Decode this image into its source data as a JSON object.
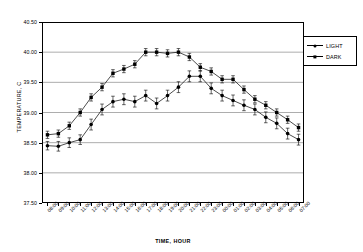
{
  "chart_data": {
    "type": "line",
    "title": "",
    "xlabel": "TIME, HOUR",
    "ylabel": "TEMPERATURE, C",
    "ylim": [
      37.5,
      40.5
    ],
    "ytick_step": 0.5,
    "ytick_labels": [
      "40.50",
      "40.00",
      "39.50",
      "39.00",
      "38.50",
      "38.00",
      "37.50"
    ],
    "ytick_values": [
      40.5,
      40.0,
      39.5,
      39.0,
      38.5,
      38.0,
      37.5
    ],
    "grid": "horizontal",
    "legend_position": "right-top",
    "error_bars": true,
    "categories": [
      "08:00",
      "09:00",
      "10:00",
      "11:00",
      "12:00",
      "13:00",
      "14:00",
      "15:00",
      "16:00",
      "17:00",
      "18:00",
      "19:00",
      "20:00",
      "21:00",
      "22:00",
      "23:00",
      "00:00",
      "01:00",
      "02:00",
      "03:00",
      "04:00",
      "05:00",
      "06:00",
      "07:00"
    ],
    "x": [
      "08:00",
      "09:00",
      "10:00",
      "11:00",
      "12:00",
      "13:00",
      "14:00",
      "15:00",
      "16:00",
      "17:00",
      "18:00",
      "19:00",
      "20:00",
      "21:00",
      "22:00",
      "23:00",
      "00:00",
      "01:00",
      "02:00",
      "03:00",
      "04:00",
      "05:00",
      "06:00",
      "07:00"
    ],
    "series": [
      {
        "name": "LIGHT",
        "marker": "circle",
        "values": [
          38.45,
          38.44,
          38.5,
          38.55,
          38.8,
          39.05,
          39.18,
          39.22,
          39.18,
          39.28,
          39.15,
          39.28,
          39.42,
          39.6,
          39.6,
          39.4,
          39.28,
          39.2,
          39.12,
          39.05,
          38.92,
          38.82,
          38.65,
          38.55
        ],
        "errors": [
          0.07,
          0.08,
          0.08,
          0.08,
          0.09,
          0.09,
          0.09,
          0.09,
          0.09,
          0.09,
          0.09,
          0.09,
          0.09,
          0.09,
          0.09,
          0.09,
          0.09,
          0.09,
          0.09,
          0.09,
          0.09,
          0.09,
          0.09,
          0.09
        ]
      },
      {
        "name": "DARK",
        "marker": "square",
        "values": [
          38.63,
          38.65,
          38.78,
          39.0,
          39.25,
          39.42,
          39.65,
          39.72,
          39.8,
          40.0,
          40.0,
          39.98,
          40.0,
          39.92,
          39.75,
          39.68,
          39.55,
          39.55,
          39.38,
          39.22,
          39.12,
          39.0,
          38.88,
          38.75
        ],
        "errors": [
          0.06,
          0.06,
          0.06,
          0.06,
          0.06,
          0.06,
          0.06,
          0.06,
          0.06,
          0.06,
          0.06,
          0.06,
          0.06,
          0.06,
          0.06,
          0.06,
          0.06,
          0.06,
          0.06,
          0.06,
          0.06,
          0.06,
          0.06,
          0.06
        ]
      }
    ],
    "colors": {
      "light_series": "#000000",
      "dark_series": "#000000",
      "grid": "#8a8a8a",
      "axis": "#000000"
    }
  },
  "legend": {
    "items": [
      {
        "label": "LIGHT",
        "marker": "circle-marker"
      },
      {
        "label": "DARK",
        "marker": "square-marker"
      }
    ]
  },
  "axes": {
    "y_title": "TEMPERATURE, C",
    "x_title": "TIME, HOUR"
  }
}
